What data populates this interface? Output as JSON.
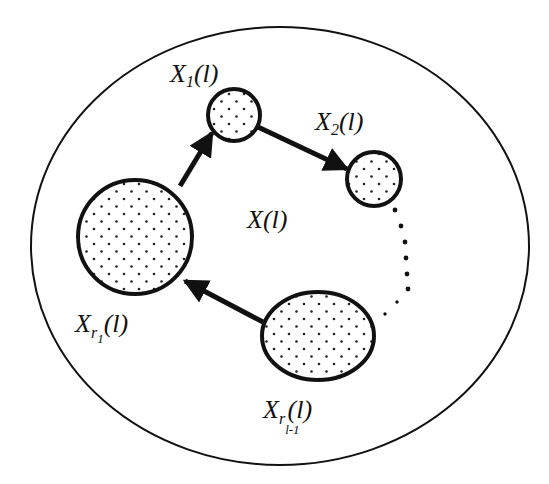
{
  "diagram": {
    "title": "",
    "background": "#ffffff",
    "stroke_color": "#111111",
    "outer_set": {
      "label": "X(l)",
      "label_base": "X",
      "label_arg": "(l)"
    },
    "nodes": [
      {
        "id": "x1",
        "label": "X1(l)",
        "base": "X",
        "sub": "1",
        "subsub": "",
        "arg": "(l)",
        "shape": "circle",
        "fill": "dotted"
      },
      {
        "id": "x2",
        "label": "X2(l)",
        "base": "X",
        "sub": "2",
        "subsub": "",
        "arg": "(l)",
        "shape": "circle",
        "fill": "dotted"
      },
      {
        "id": "xr1",
        "label": "X_{r_1}(l)",
        "base": "X",
        "sub": "r",
        "subsub": "1",
        "arg": "(l)",
        "shape": "circle",
        "fill": "dotted"
      },
      {
        "id": "xrl1",
        "label": "X_{r_{l-1}}(l)",
        "base": "X",
        "sub": "r",
        "subsub": "l-1",
        "arg": "(l)",
        "shape": "ellipse",
        "fill": "dotted"
      }
    ],
    "edges": [
      {
        "from": "xr1",
        "to": "x1",
        "style": "solid-arrow"
      },
      {
        "from": "x1",
        "to": "x2",
        "style": "solid-arrow"
      },
      {
        "from": "x2",
        "to": "xrl1",
        "style": "dotted"
      },
      {
        "from": "xrl1",
        "to": "xr1",
        "style": "solid-arrow"
      }
    ]
  }
}
